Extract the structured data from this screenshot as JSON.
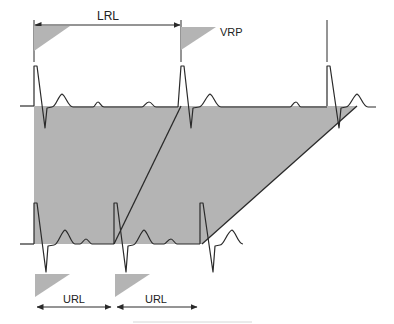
{
  "diagram": {
    "labels": {
      "lrl": "LRL",
      "vrp": "VRP",
      "url_1": "URL",
      "url_2": "URL"
    },
    "colors": {
      "shade": "#b4b4b4",
      "line": "#2a2a2a",
      "background": "#ffffff",
      "footer_rule": "#d6d6d6"
    },
    "top_trace": {
      "baseline_y": 106,
      "beats_x": [
        37,
        181,
        357
      ]
    },
    "bottom_trace": {
      "baseline_y": 244,
      "beats_x": [
        37,
        116,
        202
      ]
    }
  }
}
